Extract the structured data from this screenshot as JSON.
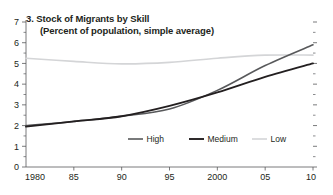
{
  "chart_data": {
    "type": "line",
    "title": "3. Stock of Migrants by Skill",
    "subtitle": "(Percent of population, simple average)",
    "xlabel": "",
    "ylabel": "",
    "xlim": [
      1980,
      2010
    ],
    "ylim": [
      0,
      7
    ],
    "grid": false,
    "legend_position": "bottom-center",
    "x_tick_labels": [
      "1980",
      "85",
      "90",
      "95",
      "2000",
      "05",
      "10"
    ],
    "x_tick_values": [
      1980,
      1985,
      1990,
      1995,
      2000,
      2005,
      2010
    ],
    "y_tick_labels": [
      "0",
      "1",
      "2",
      "3",
      "4",
      "5",
      "6",
      "7"
    ],
    "y_tick_values": [
      0,
      1,
      2,
      3,
      4,
      5,
      6,
      7
    ],
    "y_minor_ticks": [
      0.5,
      1.5,
      2.5,
      3.5,
      4.5,
      5.5,
      6.5
    ],
    "x": [
      1980,
      1985,
      1990,
      1995,
      2000,
      2005,
      2010
    ],
    "series": [
      {
        "name": "High",
        "color": "#58595b",
        "width": 1.6,
        "values": [
          2.0,
          2.2,
          2.45,
          2.8,
          3.7,
          4.9,
          5.9
        ]
      },
      {
        "name": "Medium",
        "color": "#231f20",
        "width": 1.9,
        "values": [
          1.95,
          2.2,
          2.45,
          2.95,
          3.6,
          4.35,
          5.0
        ]
      },
      {
        "name": "Low",
        "color": "#d4d5d7",
        "width": 1.6,
        "values": [
          5.25,
          5.1,
          4.98,
          5.05,
          5.25,
          5.4,
          5.4
        ]
      }
    ]
  },
  "legend": {
    "items": [
      {
        "label": "High",
        "color": "#58595b"
      },
      {
        "label": "Medium",
        "color": "#231f20"
      },
      {
        "label": "Low",
        "color": "#d4d5d7"
      }
    ]
  },
  "axis": {
    "axis_color": "#58595b",
    "tick_color": "#58595b"
  }
}
